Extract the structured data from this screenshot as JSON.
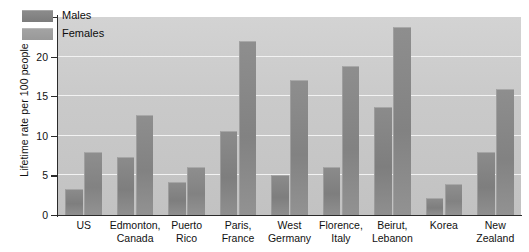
{
  "chart_data": {
    "type": "bar",
    "title": "",
    "subtitle": "",
    "xlabel": "",
    "ylabel": "Lifetime rate per 100 people",
    "ylim": [
      0,
      25
    ],
    "yticks": [
      0,
      5,
      10,
      15,
      20,
      25
    ],
    "grid": true,
    "legend_position": "top-left-inside",
    "categories": [
      "US",
      "Edmonton, Canada",
      "Puerto Rico",
      "Paris, France",
      "West Germany",
      "Florence, Italy",
      "Beirut, Lebanon",
      "Korea",
      "New Zealand"
    ],
    "category_lines": [
      [
        "US"
      ],
      [
        "Edmonton,",
        "Canada"
      ],
      [
        "Puerto",
        "Rico"
      ],
      [
        "Paris,",
        "France"
      ],
      [
        "West",
        "Germany"
      ],
      [
        "Florence,",
        "Italy"
      ],
      [
        "Beirut,",
        "Lebanon"
      ],
      [
        "Korea"
      ],
      [
        "New",
        "Zealand"
      ]
    ],
    "series": [
      {
        "name": "Males",
        "color": "#7e7e7e",
        "values": [
          3.3,
          7.3,
          4.2,
          10.6,
          5.0,
          6.1,
          13.6,
          2.2,
          8.0
        ]
      },
      {
        "name": "Females",
        "color": "#828282",
        "values": [
          8.0,
          12.6,
          6.1,
          22.0,
          17.0,
          18.8,
          23.8,
          3.9,
          15.9
        ]
      }
    ]
  },
  "legend": {
    "items": [
      {
        "label": "Males"
      },
      {
        "label": "Females"
      }
    ]
  },
  "colors": {
    "plot_background": "#cacaca",
    "gridline": "#f2f2f2",
    "axis": "#2b2b2b",
    "males_bar": "#7e7e7e",
    "females_bar": "#828282"
  }
}
